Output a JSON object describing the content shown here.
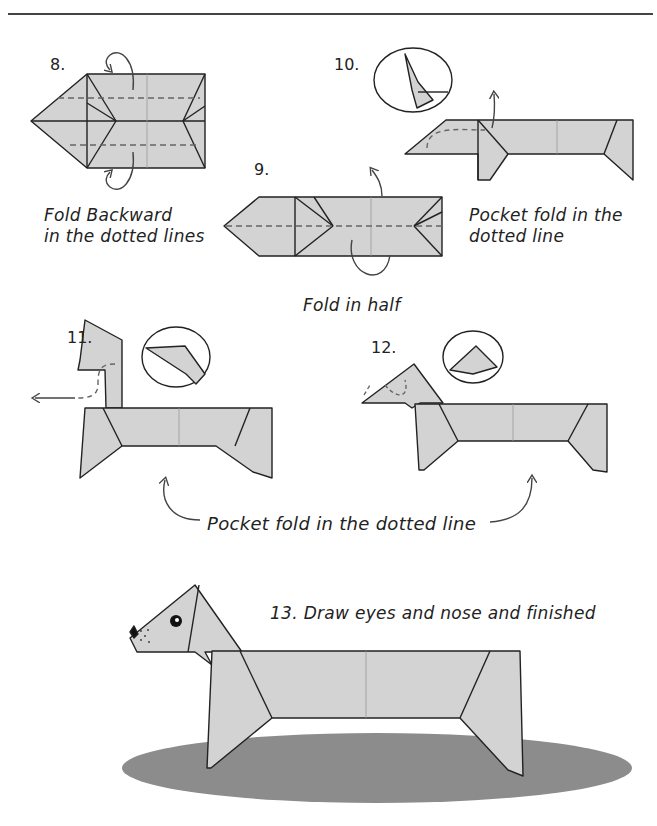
{
  "colors": {
    "paper": "#d3d3d3",
    "line": "#222222",
    "dash": "#666666",
    "shadow": "#8c8c8c",
    "background": "#ffffff"
  },
  "steps": [
    {
      "number": "8.",
      "caption": [
        "Fold Backward",
        "in the dotted lines"
      ]
    },
    {
      "number": "9.",
      "caption": [
        "Fold in half"
      ]
    },
    {
      "number": "10.",
      "caption": [
        "Pocket fold in the",
        "dotted line"
      ]
    },
    {
      "number": "11.",
      "caption": []
    },
    {
      "number": "12.",
      "caption": []
    },
    {
      "number": "13.",
      "caption": [
        "Draw eyes and nose and finished"
      ]
    }
  ],
  "shared_caption": "Pocket fold in the dotted line"
}
